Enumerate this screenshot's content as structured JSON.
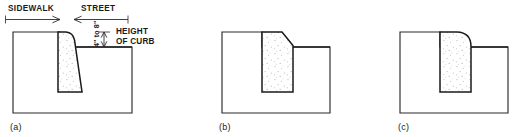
{
  "figure": {
    "title_labels": {
      "sidewalk": "SIDEWALK",
      "street": "STREET",
      "height_of_curb_line1": "HEIGHT",
      "height_of_curb_line2": "OF CURB",
      "curb_height_dim": "4\" to 8\""
    },
    "panels": [
      {
        "id": "a",
        "caption": "(a)",
        "curb_top_profile": "rounded-top-left-fillet-battered-face",
        "description": "Curb with rounded sidewalk-side top corner and sloped (battered) street face"
      },
      {
        "id": "b",
        "caption": "(b)",
        "curb_top_profile": "chamfered-top-right-corner",
        "description": "Curb with angled chamfer on the street-side top corner and vertical faces"
      },
      {
        "id": "c",
        "caption": "(c)",
        "curb_top_profile": "large-radius-rounded-top-right-corner",
        "description": "Curb with large radius fillet on the street-side top corner and vertical faces"
      }
    ],
    "colors": {
      "line": "#2b2b2b",
      "curb_line": "#1a1a1a",
      "background": "#ffffff",
      "stipple": "#b9b9b9"
    }
  }
}
